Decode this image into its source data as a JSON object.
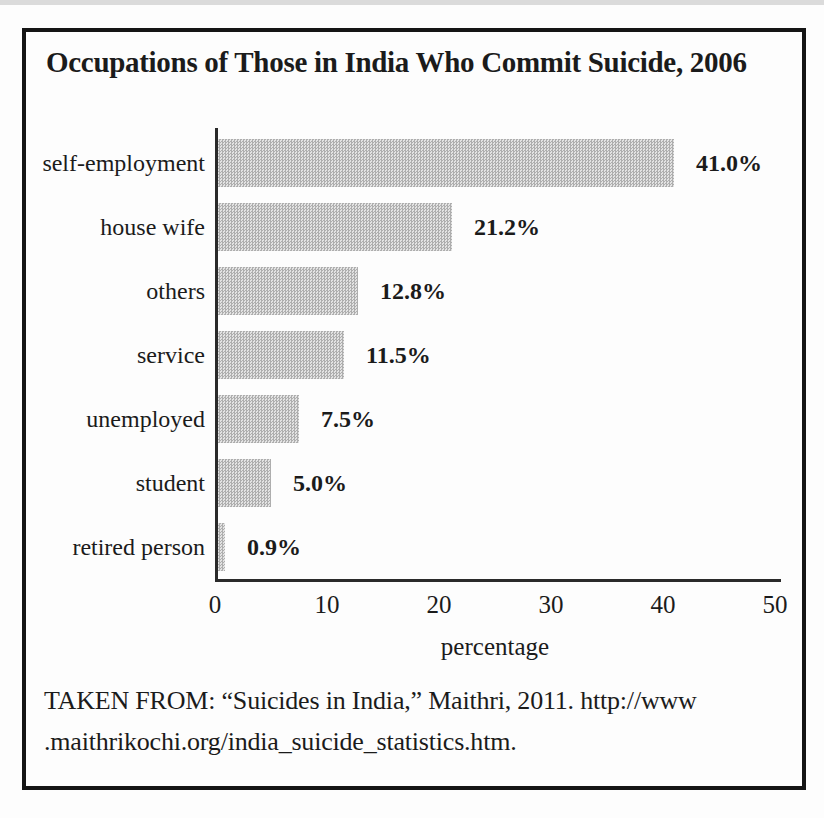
{
  "chart_data": {
    "type": "bar",
    "orientation": "horizontal",
    "title": "Occupations of Those in India Who Commit Suicide, 2006",
    "categories": [
      "self-employment",
      "house wife",
      "others",
      "service",
      "unemployed",
      "student",
      "retired person"
    ],
    "values": [
      41.0,
      21.2,
      12.8,
      11.5,
      7.5,
      5.0,
      0.9
    ],
    "value_labels": [
      "41.0%",
      "21.2%",
      "12.8%",
      "11.5%",
      "7.5%",
      "5.0%",
      "0.9%"
    ],
    "xlabel": "percentage",
    "xlim": [
      0,
      50
    ],
    "xticks": [
      "0",
      "10",
      "20",
      "30",
      "40",
      "50"
    ],
    "grid": "off",
    "legend": "none",
    "colors": {
      "bar_dark": "#aeaeae",
      "bar_light": "#e3e3e3",
      "axis": "#2a2a2a",
      "text": "#1b1b1b"
    }
  },
  "source": {
    "line1": "TAKEN FROM: “Suicides in India,” Maithri, 2011. http://www",
    "line2": ".maithrikochi.org/india_suicide_statistics.htm."
  }
}
